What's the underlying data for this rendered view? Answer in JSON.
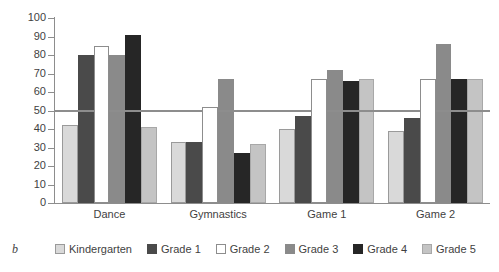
{
  "panel_letter": "b",
  "chart_data": {
    "type": "bar",
    "title": "",
    "xlabel": "",
    "ylabel": "",
    "ylim": [
      0,
      100
    ],
    "yticks": [
      0,
      10,
      20,
      30,
      40,
      50,
      60,
      70,
      80,
      90,
      100
    ],
    "grid": false,
    "legend_position": "bottom",
    "categories": [
      "Dance",
      "Gymnastics",
      "Game 1",
      "Game 2"
    ],
    "reference_line": {
      "value": 50,
      "color": "#8d8d8d"
    },
    "series": [
      {
        "name": "Kindergarten",
        "color": "#d9d9d9",
        "border": "#9a9a9a",
        "values": [
          42,
          33,
          40,
          39
        ]
      },
      {
        "name": "Grade 1",
        "color": "#4a4a4a",
        "border": "#4a4a4a",
        "values": [
          80,
          33,
          47,
          46
        ]
      },
      {
        "name": "Grade 2",
        "color": "#ffffff",
        "border": "#8d8d8d",
        "values": [
          85,
          52,
          67,
          67
        ]
      },
      {
        "name": "Grade 3",
        "color": "#8a8a8a",
        "border": "#8a8a8a",
        "values": [
          80,
          67,
          72,
          86
        ]
      },
      {
        "name": "Grade 4",
        "color": "#262626",
        "border": "#262626",
        "values": [
          91,
          27,
          66,
          67
        ]
      },
      {
        "name": "Grade 5",
        "color": "#c4c4c4",
        "border": "#a8a8a8",
        "values": [
          41,
          32,
          67,
          67
        ]
      }
    ]
  }
}
